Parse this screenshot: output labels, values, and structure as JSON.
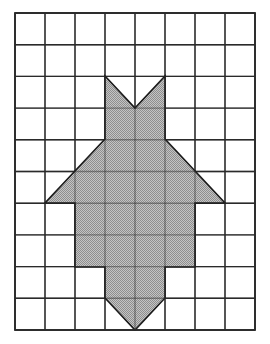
{
  "figure": {
    "canvas": {
      "width": 270,
      "height": 344,
      "background": "#ffffff"
    },
    "grid": {
      "name": "square-grid",
      "columns": 8,
      "rows": 10,
      "origin_x": 15,
      "origin_y": 13,
      "cell_width": 30,
      "cell_height": 31.7,
      "right_x": 255,
      "bottom_y": 330,
      "line_color": "#2b2b2b",
      "line_width": 1.4,
      "outer_border_width": 1.8,
      "visible": true
    },
    "shape": {
      "name": "shaded-polygon",
      "fill_color": "#aaaaaa",
      "fill_pattern": "halftone-dither",
      "stroke_color": "#1a1a1a",
      "stroke_width": 1.6,
      "symmetry": "vertical-mirror about x = 135",
      "vertices": [
        [
          105,
          76
        ],
        [
          135,
          108
        ],
        [
          165,
          76
        ],
        [
          165,
          139
        ],
        [
          225,
          203
        ],
        [
          195,
          203
        ],
        [
          195,
          267
        ],
        [
          165,
          267
        ],
        [
          165,
          298
        ],
        [
          135,
          330
        ],
        [
          105,
          298
        ],
        [
          105,
          267
        ],
        [
          75,
          267
        ],
        [
          75,
          203
        ],
        [
          45,
          203
        ],
        [
          105,
          139
        ]
      ],
      "grid_vertices": [
        [
          3,
          2
        ],
        [
          4,
          3
        ],
        [
          5,
          2
        ],
        [
          5,
          4
        ],
        [
          7,
          6
        ],
        [
          6,
          6
        ],
        [
          6,
          8
        ],
        [
          5,
          8
        ],
        [
          5,
          9
        ],
        [
          4,
          10
        ],
        [
          3,
          9
        ],
        [
          3,
          8
        ],
        [
          2,
          8
        ],
        [
          2,
          6
        ],
        [
          1,
          6
        ],
        [
          3,
          4
        ]
      ]
    }
  }
}
